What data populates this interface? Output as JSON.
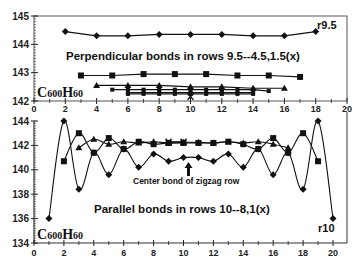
{
  "chart_data": [
    {
      "type": "line",
      "panel": "top",
      "title": "Perpendicular bonds in rows 9.5--4.5,1.5(x)",
      "formula_label": "C600H60",
      "end_label": "r9.5",
      "xlabel": "",
      "ylabel": "",
      "xlim": [
        0,
        20
      ],
      "ylim": [
        142,
        145
      ],
      "x_ticks": [
        "0",
        "2",
        "4",
        "6",
        "8",
        "10",
        "12",
        "14",
        "16",
        "18",
        "20"
      ],
      "y_ticks": [
        "142",
        "143",
        "144",
        "145"
      ],
      "grid": false,
      "series": [
        {
          "name": "r9.5",
          "marker": "diamond",
          "x": [
            2,
            4,
            6,
            8,
            10,
            12,
            14,
            16,
            18
          ],
          "values": [
            144.45,
            144.3,
            144.3,
            144.35,
            144.35,
            144.35,
            144.3,
            144.3,
            144.45
          ]
        },
        {
          "name": "row (square)",
          "marker": "square",
          "x": [
            3,
            5,
            7,
            9,
            11,
            13,
            15,
            17
          ],
          "values": [
            142.9,
            142.9,
            142.95,
            142.95,
            142.95,
            142.9,
            142.9,
            142.85
          ]
        },
        {
          "name": "row (triangle)",
          "marker": "triangle",
          "x": [
            4,
            6,
            8,
            10,
            12,
            14,
            16
          ],
          "values": [
            142.55,
            142.55,
            142.55,
            142.5,
            142.5,
            142.45,
            142.45
          ]
        },
        {
          "name": "row (small square a)",
          "marker": "small-square",
          "x": [
            5,
            6,
            7,
            8,
            9,
            10,
            11,
            12,
            13,
            14,
            15
          ],
          "values": [
            142.4,
            142.4,
            142.4,
            142.4,
            142.4,
            142.4,
            142.4,
            142.4,
            142.4,
            142.4,
            142.35
          ]
        },
        {
          "name": "row (small square b)",
          "marker": "small-square",
          "x": [
            6,
            7,
            8,
            9,
            10,
            11,
            12,
            13,
            14
          ],
          "values": [
            142.3,
            142.3,
            142.3,
            142.3,
            142.3,
            142.3,
            142.3,
            142.3,
            142.3
          ]
        },
        {
          "name": "row (small square c)",
          "marker": "small-square",
          "x": [
            6,
            7,
            8,
            9,
            10,
            11,
            12,
            13,
            14
          ],
          "values": [
            142.25,
            142.25,
            142.25,
            142.25,
            142.25,
            142.25,
            142.25,
            142.25,
            142.25
          ]
        },
        {
          "name": "r1.5 (x)",
          "marker": "x",
          "x": [
            10
          ],
          "values": [
            142.15
          ]
        }
      ]
    },
    {
      "type": "line",
      "panel": "bottom",
      "title": "Parallel bonds in rows 10--8,1(x)",
      "formula_label": "C600H60",
      "end_label": "r10",
      "annotation": "Center bond of zigzag row",
      "annotation_x": 10.2,
      "xlabel": "",
      "ylabel": "",
      "xlim": [
        0,
        20
      ],
      "ylim": [
        134,
        144.5
      ],
      "x_ticks": [
        "0",
        "2",
        "4",
        "6",
        "8",
        "10",
        "12",
        "14",
        "16",
        "18",
        "20"
      ],
      "y_ticks": [
        "134",
        "136",
        "138",
        "140",
        "142",
        "144"
      ],
      "grid": false,
      "series": [
        {
          "name": "r10",
          "marker": "diamond",
          "x": [
            1,
            2,
            3,
            4,
            5,
            6,
            7,
            8,
            9,
            10,
            11,
            12,
            13,
            14,
            15,
            16,
            17,
            18,
            19,
            20
          ],
          "values": [
            136,
            144,
            138.4,
            141.4,
            139.6,
            141.7,
            140.2,
            141.3,
            140.7,
            141,
            141,
            140.7,
            141.3,
            140.2,
            141.7,
            139.6,
            141.4,
            138.4,
            144,
            136
          ]
        },
        {
          "name": "row (square)",
          "marker": "square",
          "x": [
            2,
            3,
            4,
            5,
            6,
            7,
            8,
            9,
            10,
            11,
            12,
            13,
            14,
            15,
            16,
            17,
            18,
            19
          ],
          "values": [
            140.7,
            143,
            141.4,
            142.6,
            141.7,
            142.3,
            142.1,
            142.2,
            142.2,
            142.2,
            142.2,
            142.3,
            142.1,
            141.7,
            142.6,
            141.4,
            143,
            140.7
          ]
        },
        {
          "name": "row (triangle)",
          "marker": "triangle",
          "x": [
            3,
            4,
            5,
            6,
            7,
            8,
            9,
            10,
            11,
            12,
            13,
            14,
            15,
            16,
            17
          ],
          "values": [
            141.8,
            142.5,
            142.1,
            142.3,
            142.2,
            142.3,
            142.2,
            142.25,
            142.25,
            142.2,
            142.3,
            142.2,
            142.3,
            142.1,
            141.8
          ]
        },
        {
          "name": "r1 (x)",
          "marker": "x",
          "x": [
            9,
            10
          ],
          "values": [
            142.3,
            142.3
          ]
        }
      ]
    }
  ],
  "colors": {
    "line": "#111111",
    "axis": "#222222",
    "background": "#ffffff"
  }
}
